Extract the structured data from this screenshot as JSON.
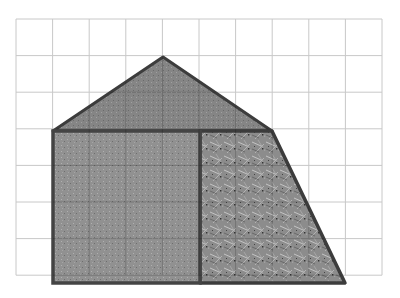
{
  "diagram": {
    "grid": {
      "x0": 16,
      "y0": 19,
      "cols": 10,
      "rows": 7,
      "cell": 36.6,
      "color": "#c8c8c8"
    },
    "shapes": {
      "roof": {
        "label": "triangle",
        "points": "53,131 163,57 272,131",
        "fill": "#8a8a8a",
        "stroke": "#3c3c3c"
      },
      "square": {
        "label": "square",
        "x": 53,
        "y": 131,
        "w": 147,
        "h": 152,
        "fill": "#929292",
        "stroke": "#444444"
      },
      "trapezoid": {
        "label": "right-trapezoid-section",
        "points": "200,131 272,131 345,283 200,283",
        "fill": "#9a9a9a",
        "stroke": "#3c3c3c"
      }
    }
  }
}
